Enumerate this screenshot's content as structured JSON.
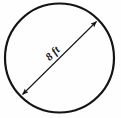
{
  "figure": {
    "kind": "geometry-diagram",
    "shape": "circle",
    "background_color": "#fefefe",
    "stroke_color": "#141414",
    "label_color": "#111111"
  },
  "circle": {
    "name": "circle-outline",
    "center_x": 59.5,
    "center_y": 58,
    "radius": 54.5,
    "stroke_width": 2.2
  },
  "dimension": {
    "name": "diameter",
    "label": "8 ft",
    "value": 8,
    "unit": "ft",
    "label_rotation_deg": -45,
    "label_x": 55,
    "label_y": 56,
    "font_size": 11,
    "line": {
      "x1": 22.5,
      "y1": 94.5,
      "x2": 96.5,
      "y2": 21.5,
      "stroke_width": 1.1,
      "arrowheads": "both"
    }
  },
  "arrowheads": [
    {
      "name": "arrowhead-upper-right",
      "tip_x": 96.5,
      "tip_y": 21.5
    },
    {
      "name": "arrowhead-lower-left",
      "tip_x": 22.5,
      "tip_y": 94.5
    }
  ]
}
